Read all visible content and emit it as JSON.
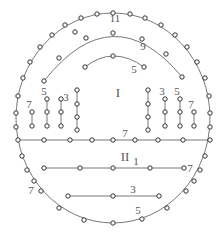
{
  "diagram": {
    "colors": {
      "line": "#555555",
      "hole_stroke": "#333333",
      "hole_fill": "#ffffff",
      "text": "#555555"
    },
    "hole_radius": 2.2,
    "regions": [
      {
        "id": "region-I",
        "label": "I",
        "x": 118,
        "y": 97
      },
      {
        "id": "region-II",
        "label": "II",
        "x": 125,
        "y": 161
      }
    ],
    "outer_contour": {
      "label": "11",
      "cx": 113,
      "cy": 118,
      "rx": 97,
      "ry": 105,
      "label_pos": {
        "x": 115,
        "y": 22
      },
      "holes": [
        [
          113,
          13
        ],
        [
          97,
          14
        ],
        [
          130,
          14
        ],
        [
          81,
          18
        ],
        [
          145,
          18
        ],
        [
          65,
          25
        ],
        [
          161,
          25
        ],
        [
          52,
          35
        ],
        [
          175,
          35
        ],
        [
          40,
          47
        ],
        [
          187,
          47
        ],
        [
          30,
          62
        ],
        [
          197,
          62
        ],
        [
          23,
          78
        ],
        [
          205,
          78
        ],
        [
          18,
          96
        ],
        [
          209,
          96
        ],
        [
          16,
          113
        ],
        [
          210,
          113
        ],
        [
          16,
          127
        ],
        [
          210,
          127
        ],
        [
          22,
          156
        ],
        [
          205,
          156
        ],
        [
          27,
          170
        ],
        [
          200,
          170
        ],
        [
          34,
          181
        ],
        [
          194,
          181
        ],
        [
          41,
          191
        ],
        [
          186,
          191
        ],
        [
          59,
          208
        ],
        [
          167,
          208
        ],
        [
          84,
          220
        ],
        [
          142,
          219
        ],
        [
          113,
          223
        ]
      ]
    },
    "arcs": [
      {
        "label": "9",
        "path": "M44,81 Q113,-6 182,77",
        "label_pos": {
          "x": 143,
          "y": 50
        },
        "holes": [
          [
            44,
            81
          ],
          [
            59,
            58
          ],
          [
            86,
            38
          ],
          [
            113,
            33
          ],
          [
            142,
            39
          ],
          [
            166,
            54
          ],
          [
            182,
            77
          ]
        ]
      },
      {
        "label": "5",
        "path": "M85,67 Q113,45 144,67",
        "label_pos": {
          "x": 134,
          "y": 73
        },
        "holes": [
          [
            85,
            67
          ],
          [
            113,
            56
          ],
          [
            144,
            67
          ]
        ]
      }
    ],
    "isolated_holes": [
      [
        75,
        32
      ]
    ],
    "horizontal_lines": [
      {
        "label": "7",
        "y": 140,
        "x1": 18,
        "x2": 210,
        "label_pos": {
          "x": 125,
          "y": 137
        },
        "holes": [
          18,
          44,
          70,
          92,
          113,
          135,
          158,
          183,
          210
        ]
      },
      {
        "label": "1",
        "y": 168,
        "x1": 44,
        "x2": 184,
        "label_pos": {
          "x": 136,
          "y": 165
        },
        "extra_label": "7",
        "extra_label_pos": {
          "x": 190,
          "y": 172
        },
        "holes": [
          44,
          80,
          113,
          150,
          184
        ]
      },
      {
        "label": "3",
        "y": 196,
        "x1": 68,
        "x2": 159,
        "label_pos": {
          "x": 133,
          "y": 193
        },
        "holes": [
          68,
          113,
          159
        ]
      }
    ],
    "vertical_lines": [
      {
        "label": "7",
        "x": 32,
        "y1": 112,
        "y2": 126,
        "label_pos": {
          "x": 29,
          "y": 108
        },
        "holes": [
          112,
          126
        ]
      },
      {
        "label": "5",
        "x": 47,
        "y1": 99,
        "y2": 126,
        "label_pos": {
          "x": 44,
          "y": 95
        },
        "holes": [
          99,
          112,
          126
        ]
      },
      {
        "label": "3",
        "x": 61,
        "y1": 99,
        "y2": 126,
        "label_pos": {
          "x": 66,
          "y": 101
        },
        "holes": [
          99,
          112,
          126
        ]
      },
      {
        "label": "",
        "x": 77,
        "y1": 90,
        "y2": 130,
        "label_pos": null,
        "holes": [
          90,
          104,
          117,
          130
        ]
      },
      {
        "label": "",
        "x": 148,
        "y1": 90,
        "y2": 130,
        "label_pos": null,
        "holes": [
          90,
          104,
          117,
          130
        ]
      },
      {
        "label": "3",
        "x": 165,
        "y1": 99,
        "y2": 126,
        "label_pos": {
          "x": 162,
          "y": 95
        },
        "holes": [
          99,
          112,
          126
        ]
      },
      {
        "label": "5",
        "x": 180,
        "y1": 99,
        "y2": 126,
        "label_pos": {
          "x": 177,
          "y": 95
        },
        "holes": [
          99,
          112,
          126
        ]
      },
      {
        "label": "7",
        "x": 194,
        "y1": 112,
        "y2": 126,
        "label_pos": {
          "x": 191,
          "y": 108
        },
        "holes": [
          112,
          126
        ]
      }
    ],
    "side_labels": [
      {
        "label": "7",
        "x": 31,
        "y": 194
      },
      {
        "label": "5",
        "x": 138,
        "y": 214
      }
    ]
  }
}
